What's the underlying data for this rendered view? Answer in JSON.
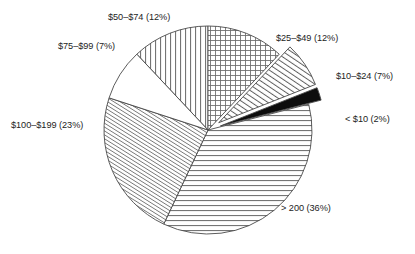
{
  "chart_data": {
    "type": "pie",
    "title": "",
    "subtitle": "",
    "xlabel": "",
    "ylabel": "",
    "legend_position": "none",
    "grid": false,
    "labels_inline": true,
    "units": "percent",
    "categories": [
      "$50–$74",
      "$25–$49",
      "$10–$24",
      "< $10",
      "> 200",
      "$100–$199",
      "$75–$99"
    ],
    "values": [
      12,
      12,
      7,
      2,
      36,
      23,
      7
    ],
    "slices": [
      {
        "id": "slice-50-74",
        "category": "$50–$74",
        "value": 12,
        "label": "$50–$74 (12%)",
        "pattern": "vertical-lines",
        "exploded": false,
        "start_angle": -43.2,
        "end_angle": 0.0,
        "label_x": 108,
        "label_y": 12
      },
      {
        "id": "slice-25-49",
        "category": "$25–$49",
        "value": 12,
        "label": "$25–$49 (12%)",
        "pattern": "crosshatch",
        "exploded": false,
        "start_angle": 0.0,
        "end_angle": 43.2,
        "label_x": 276,
        "label_y": 33
      },
      {
        "id": "slice-10-24",
        "category": "$10–$24",
        "value": 7,
        "label": "$10–$24 (7%)",
        "pattern": "diagonal-hatch",
        "exploded": true,
        "start_angle": 43.2,
        "end_angle": 68.4,
        "label_x": 336,
        "label_y": 71
      },
      {
        "id": "slice-under-10",
        "category": "< $10",
        "value": 2,
        "label": "< $10 (2%)",
        "pattern": "solid-black",
        "exploded": true,
        "start_angle": 68.4,
        "end_angle": 75.6,
        "label_x": 345,
        "label_y": 114
      },
      {
        "id": "slice-over-200",
        "category": "> 200",
        "value": 36,
        "label": "> 200 (36%)",
        "pattern": "horizontal-lines",
        "exploded": false,
        "start_angle": 75.6,
        "end_angle": 205.2,
        "label_x": 281,
        "label_y": 203
      },
      {
        "id": "slice-100-199",
        "category": "$100–$199",
        "value": 23,
        "label": "$100–$199 (23%)",
        "pattern": "fine-diagonal-hatch",
        "exploded": false,
        "start_angle": 205.2,
        "end_angle": 288.0,
        "label_x": 11,
        "label_y": 120
      },
      {
        "id": "slice-75-99",
        "category": "$75–$99",
        "value": 7,
        "label": "$75–$99 (7%)",
        "pattern": "blank-white",
        "exploded": false,
        "start_angle": 288.0,
        "end_angle": 316.8,
        "label_x": 58,
        "label_y": 41
      }
    ],
    "geometry": {
      "center_x": 208,
      "center_y": 130,
      "radius": 104,
      "explode_offset": 13
    },
    "style": {
      "stroke_color": "#4a4a4a",
      "label_color": "#1d1d1d",
      "background": "#ffffff",
      "solid_fill": "#0d0d0d"
    }
  },
  "artifact": {
    "top_edge_text": ""
  }
}
